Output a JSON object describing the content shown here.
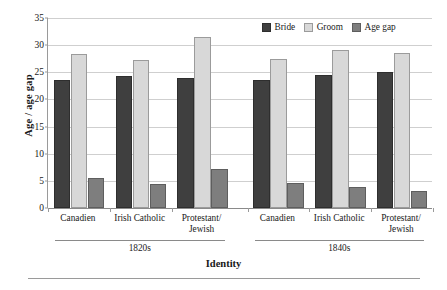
{
  "chart_data": {
    "type": "bar",
    "title": "",
    "xlabel": "Identity",
    "ylabel": "Age / age gap",
    "ylim": [
      0,
      35
    ],
    "ytick_step": 5,
    "yticks": [
      "0",
      "5",
      "10",
      "15",
      "20",
      "25",
      "30",
      "35"
    ],
    "grid": true,
    "legend_position": "top-right",
    "categories": [
      "Canadien",
      "Irish Catholic",
      "Protestant/\nJewish",
      "Canadien",
      "Irish Catholic",
      "Protestant/\nJewish"
    ],
    "category_lines": [
      [
        "Canadien"
      ],
      [
        "Irish Catholic"
      ],
      [
        "Protestant/",
        "Jewish"
      ],
      [
        "Canadien"
      ],
      [
        "Irish Catholic"
      ],
      [
        "Protestant/",
        "Jewish"
      ]
    ],
    "groups": [
      {
        "label": "1820s",
        "categories": [
          "Canadien",
          "Irish Catholic",
          "Protestant/Jewish"
        ]
      },
      {
        "label": "1840s",
        "categories": [
          "Canadien",
          "Irish Catholic",
          "Protestant/Jewish"
        ]
      }
    ],
    "series": [
      {
        "name": "Bride",
        "color": "#3f3f3f",
        "values": [
          23.5,
          24.3,
          23.9,
          23.6,
          24.5,
          25.0
        ]
      },
      {
        "name": "Groom",
        "color": "#d8d8d8",
        "values": [
          28.3,
          27.2,
          31.5,
          27.5,
          29.2,
          28.6
        ]
      },
      {
        "name": "Age gap",
        "color": "#7e7e7e",
        "values": [
          5.6,
          4.4,
          7.1,
          4.6,
          3.9,
          3.2
        ]
      }
    ]
  },
  "legend": {
    "items": [
      {
        "label": "Bride",
        "swatch": "bride"
      },
      {
        "label": "Groom",
        "swatch": "groom"
      },
      {
        "label": "Age gap",
        "swatch": "gap"
      }
    ]
  },
  "colors": {
    "bride": "#3f3f3f",
    "groom": "#d8d8d8",
    "age_gap": "#7e7e7e",
    "grid": "#cfcfcf",
    "axis": "#8a8a8a"
  }
}
